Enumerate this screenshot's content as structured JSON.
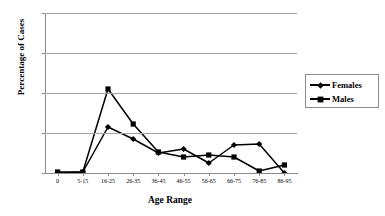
{
  "chart_data": {
    "type": "line",
    "title": "",
    "xlabel": "Age Range",
    "ylabel": "Percentage of Cases",
    "categories": [
      "0",
      "5-15",
      "16-25",
      "26-35",
      "36-45",
      "46-55",
      "56-65",
      "66-75",
      "76-85",
      "86-95"
    ],
    "ylim": [
      0,
      80
    ],
    "yticks": [
      0,
      20,
      40,
      60,
      80
    ],
    "grid": true,
    "legend_position": "right",
    "series": [
      {
        "name": "Females",
        "marker": "diamond",
        "color": "#000000",
        "values": [
          0,
          0.5,
          23,
          17,
          10,
          12,
          5,
          14,
          14.5,
          0
        ]
      },
      {
        "name": "Males",
        "marker": "square",
        "color": "#000000",
        "values": [
          0.5,
          0.5,
          42,
          24.5,
          10.5,
          8,
          9,
          8,
          1,
          4
        ]
      }
    ]
  },
  "axes": {
    "y_tick_labels": [
      "0",
      "20",
      "40",
      "60",
      "80"
    ],
    "x_tick_labels": [
      "0",
      "5-15",
      "16-25",
      "26-35",
      "36-45",
      "46-55",
      "56-65",
      "66-75",
      "76-85",
      "86-95"
    ],
    "x_title": "Age Range",
    "y_title": "Percentage of Cases"
  },
  "legend": {
    "entries": [
      {
        "label": "Females"
      },
      {
        "label": "Males"
      }
    ]
  },
  "colors": {
    "line": "#000000",
    "grid": "#a6a6a6",
    "axis": "#8c8c8c",
    "background": "#ffffff"
  }
}
